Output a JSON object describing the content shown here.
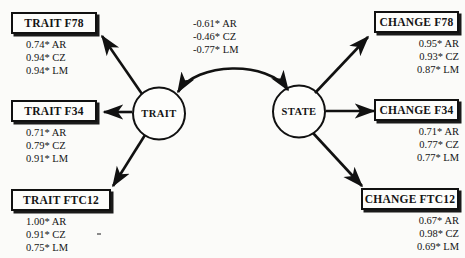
{
  "diagram": {
    "background_color": "#fbfbf9",
    "line_color": "#111111",
    "latents": [
      {
        "id": "trait",
        "label": "TRAIT"
      },
      {
        "id": "state",
        "label": "STATE"
      }
    ],
    "indicators": [
      {
        "id": "trait-f78",
        "label": "TRAIT F78",
        "side": "left",
        "loadings": [
          "0.74* AR",
          "0.94* CZ",
          "0.94* LM"
        ]
      },
      {
        "id": "trait-f34",
        "label": "TRAIT F34",
        "side": "left",
        "loadings": [
          "0.71* AR",
          "0.79* CZ",
          "0.91* LM"
        ]
      },
      {
        "id": "trait-ftc12",
        "label": "TRAIT FTC12",
        "side": "left",
        "loadings": [
          "1.00* AR",
          "0.91* CZ",
          "0.75* LM"
        ]
      },
      {
        "id": "change-f78",
        "label": "CHANGE F78",
        "side": "right",
        "loadings": [
          "0.95* AR",
          "0.93* CZ",
          "0.87* LM"
        ]
      },
      {
        "id": "change-f34",
        "label": "CHANGE F34",
        "side": "right",
        "loadings": [
          "0.71* AR",
          "0.77* CZ",
          "0.77* LM"
        ]
      },
      {
        "id": "change-ftc12",
        "label": "CHANGE FTC12",
        "side": "right",
        "loadings": [
          "0.67* AR",
          "0.98* CZ",
          "0.69* LM"
        ]
      }
    ],
    "correlation": {
      "between": [
        "TRAIT",
        "STATE"
      ],
      "values": [
        "-0.61* AR",
        "-0.46* CZ",
        "-0.77* LM"
      ]
    },
    "groups": [
      "AR",
      "CZ",
      "LM"
    ],
    "significance_marker": "*"
  }
}
